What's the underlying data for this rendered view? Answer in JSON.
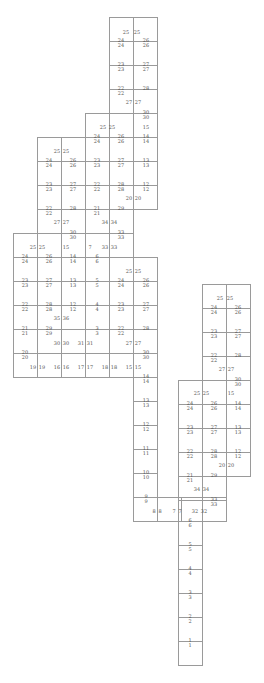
{
  "diagram": {
    "title": "",
    "cell_size": 24,
    "line_color": "#9a9a9a",
    "text_color": "#555555",
    "cells": [
      [
        109,
        17
      ],
      [
        133,
        17
      ],
      [
        109,
        41
      ],
      [
        133,
        41
      ],
      [
        109,
        65
      ],
      [
        133,
        65
      ],
      [
        109,
        89
      ],
      [
        133,
        89
      ],
      [
        85,
        113
      ],
      [
        109,
        113
      ],
      [
        133,
        113
      ],
      [
        37,
        137
      ],
      [
        61,
        137
      ],
      [
        85,
        137
      ],
      [
        109,
        137
      ],
      [
        133,
        137
      ],
      [
        37,
        161
      ],
      [
        61,
        161
      ],
      [
        85,
        161
      ],
      [
        109,
        161
      ],
      [
        133,
        161
      ],
      [
        37,
        185
      ],
      [
        61,
        185
      ],
      [
        85,
        185
      ],
      [
        109,
        185
      ],
      [
        133,
        185
      ],
      [
        37,
        209
      ],
      [
        61,
        209
      ],
      [
        85,
        209
      ],
      [
        109,
        209
      ],
      [
        13,
        233
      ],
      [
        37,
        233
      ],
      [
        61,
        233
      ],
      [
        85,
        233
      ],
      [
        109,
        233
      ],
      [
        13,
        257
      ],
      [
        37,
        257
      ],
      [
        61,
        257
      ],
      [
        85,
        257
      ],
      [
        109,
        257
      ],
      [
        133,
        257
      ],
      [
        13,
        281
      ],
      [
        37,
        281
      ],
      [
        61,
        281
      ],
      [
        85,
        281
      ],
      [
        109,
        281
      ],
      [
        133,
        281
      ],
      [
        13,
        305
      ],
      [
        37,
        305
      ],
      [
        61,
        305
      ],
      [
        85,
        305
      ],
      [
        109,
        305
      ],
      [
        133,
        305
      ],
      [
        13,
        329
      ],
      [
        37,
        329
      ],
      [
        61,
        329
      ],
      [
        85,
        329
      ],
      [
        109,
        329
      ],
      [
        133,
        329
      ],
      [
        13,
        353
      ],
      [
        37,
        353
      ],
      [
        61,
        353
      ],
      [
        85,
        353
      ],
      [
        109,
        353
      ],
      [
        133,
        353
      ],
      [
        133,
        377
      ],
      [
        133,
        401
      ],
      [
        133,
        425
      ],
      [
        133,
        449
      ],
      [
        133,
        473
      ],
      [
        133,
        497
      ],
      [
        202,
        284
      ],
      [
        226,
        284
      ],
      [
        202,
        308
      ],
      [
        226,
        308
      ],
      [
        202,
        332
      ],
      [
        226,
        332
      ],
      [
        202,
        356
      ],
      [
        226,
        356
      ],
      [
        178,
        380
      ],
      [
        202,
        380
      ],
      [
        226,
        380
      ],
      [
        178,
        404
      ],
      [
        202,
        404
      ],
      [
        226,
        404
      ],
      [
        178,
        428
      ],
      [
        202,
        428
      ],
      [
        226,
        428
      ],
      [
        178,
        452
      ],
      [
        202,
        452
      ],
      [
        226,
        452
      ],
      [
        178,
        476
      ],
      [
        202,
        476
      ],
      [
        157,
        497
      ],
      [
        178,
        497
      ],
      [
        202,
        497
      ],
      [
        178,
        521
      ],
      [
        178,
        545
      ],
      [
        178,
        569
      ],
      [
        178,
        593
      ],
      [
        178,
        617
      ],
      [
        178,
        641
      ]
    ],
    "labels": [
      {
        "x": 126,
        "y": 32,
        "t": "25"
      },
      {
        "x": 137,
        "y": 32,
        "t": "25"
      },
      {
        "x": 121,
        "y": 40,
        "t": "24"
      },
      {
        "x": 146,
        "y": 40,
        "t": "26"
      },
      {
        "x": 121,
        "y": 45,
        "t": "24"
      },
      {
        "x": 146,
        "y": 45,
        "t": "26"
      },
      {
        "x": 121,
        "y": 64,
        "t": "23"
      },
      {
        "x": 146,
        "y": 64,
        "t": "27"
      },
      {
        "x": 121,
        "y": 69,
        "t": "23"
      },
      {
        "x": 146,
        "y": 69,
        "t": "27"
      },
      {
        "x": 121,
        "y": 88,
        "t": "22"
      },
      {
        "x": 146,
        "y": 88,
        "t": "28"
      },
      {
        "x": 121,
        "y": 93,
        "t": "22"
      },
      {
        "x": 129,
        "y": 102,
        "t": "27"
      },
      {
        "x": 138,
        "y": 102,
        "t": "27"
      },
      {
        "x": 146,
        "y": 112,
        "t": "30"
      },
      {
        "x": 146,
        "y": 117,
        "t": "30"
      },
      {
        "x": 103,
        "y": 127,
        "t": "25"
      },
      {
        "x": 112,
        "y": 127,
        "t": "25"
      },
      {
        "x": 146,
        "y": 127,
        "t": "15"
      },
      {
        "x": 97,
        "y": 136,
        "t": "24"
      },
      {
        "x": 121,
        "y": 136,
        "t": "26"
      },
      {
        "x": 146,
        "y": 136,
        "t": "14"
      },
      {
        "x": 97,
        "y": 141,
        "t": "24"
      },
      {
        "x": 121,
        "y": 141,
        "t": "26"
      },
      {
        "x": 146,
        "y": 141,
        "t": "14"
      },
      {
        "x": 57,
        "y": 151,
        "t": "25"
      },
      {
        "x": 66,
        "y": 151,
        "t": "25"
      },
      {
        "x": 49,
        "y": 160,
        "t": "24"
      },
      {
        "x": 73,
        "y": 160,
        "t": "26"
      },
      {
        "x": 97,
        "y": 160,
        "t": "23"
      },
      {
        "x": 121,
        "y": 160,
        "t": "27"
      },
      {
        "x": 146,
        "y": 160,
        "t": "13"
      },
      {
        "x": 49,
        "y": 165,
        "t": "24"
      },
      {
        "x": 73,
        "y": 165,
        "t": "26"
      },
      {
        "x": 97,
        "y": 165,
        "t": "23"
      },
      {
        "x": 121,
        "y": 165,
        "t": "27"
      },
      {
        "x": 146,
        "y": 165,
        "t": "13"
      },
      {
        "x": 49,
        "y": 184,
        "t": "23"
      },
      {
        "x": 73,
        "y": 184,
        "t": "27"
      },
      {
        "x": 97,
        "y": 184,
        "t": "22"
      },
      {
        "x": 121,
        "y": 184,
        "t": "28"
      },
      {
        "x": 146,
        "y": 184,
        "t": "12"
      },
      {
        "x": 49,
        "y": 189,
        "t": "23"
      },
      {
        "x": 73,
        "y": 189,
        "t": "27"
      },
      {
        "x": 97,
        "y": 189,
        "t": "22"
      },
      {
        "x": 121,
        "y": 189,
        "t": "28"
      },
      {
        "x": 146,
        "y": 189,
        "t": "12"
      },
      {
        "x": 129,
        "y": 198,
        "t": "20"
      },
      {
        "x": 138,
        "y": 198,
        "t": "20"
      },
      {
        "x": 49,
        "y": 208,
        "t": "22"
      },
      {
        "x": 73,
        "y": 208,
        "t": "28"
      },
      {
        "x": 97,
        "y": 208,
        "t": "21"
      },
      {
        "x": 121,
        "y": 208,
        "t": "29"
      },
      {
        "x": 49,
        "y": 213,
        "t": "22"
      },
      {
        "x": 97,
        "y": 213,
        "t": "21"
      },
      {
        "x": 57,
        "y": 222,
        "t": "27"
      },
      {
        "x": 66,
        "y": 222,
        "t": "27"
      },
      {
        "x": 105,
        "y": 222,
        "t": "34"
      },
      {
        "x": 114,
        "y": 222,
        "t": "34"
      },
      {
        "x": 73,
        "y": 232,
        "t": "30"
      },
      {
        "x": 121,
        "y": 232,
        "t": "33"
      },
      {
        "x": 73,
        "y": 237,
        "t": "30"
      },
      {
        "x": 121,
        "y": 237,
        "t": "33"
      },
      {
        "x": 33,
        "y": 247,
        "t": "25"
      },
      {
        "x": 42,
        "y": 247,
        "t": "25"
      },
      {
        "x": 66,
        "y": 247,
        "t": "15"
      },
      {
        "x": 90,
        "y": 247,
        "t": "7"
      },
      {
        "x": 105,
        "y": 247,
        "t": "33"
      },
      {
        "x": 114,
        "y": 247,
        "t": "33"
      },
      {
        "x": 25,
        "y": 256,
        "t": "24"
      },
      {
        "x": 49,
        "y": 256,
        "t": "26"
      },
      {
        "x": 73,
        "y": 256,
        "t": "14"
      },
      {
        "x": 97,
        "y": 256,
        "t": "6"
      },
      {
        "x": 25,
        "y": 261,
        "t": "24"
      },
      {
        "x": 49,
        "y": 261,
        "t": "26"
      },
      {
        "x": 73,
        "y": 261,
        "t": "14"
      },
      {
        "x": 97,
        "y": 261,
        "t": "6"
      },
      {
        "x": 129,
        "y": 271,
        "t": "25"
      },
      {
        "x": 138,
        "y": 271,
        "t": "25"
      },
      {
        "x": 25,
        "y": 280,
        "t": "23"
      },
      {
        "x": 49,
        "y": 280,
        "t": "27"
      },
      {
        "x": 73,
        "y": 280,
        "t": "13"
      },
      {
        "x": 97,
        "y": 280,
        "t": "5"
      },
      {
        "x": 121,
        "y": 280,
        "t": "24"
      },
      {
        "x": 146,
        "y": 280,
        "t": "26"
      },
      {
        "x": 25,
        "y": 285,
        "t": "23"
      },
      {
        "x": 49,
        "y": 285,
        "t": "27"
      },
      {
        "x": 73,
        "y": 285,
        "t": "13"
      },
      {
        "x": 97,
        "y": 285,
        "t": "5"
      },
      {
        "x": 121,
        "y": 285,
        "t": "24"
      },
      {
        "x": 146,
        "y": 285,
        "t": "26"
      },
      {
        "x": 25,
        "y": 304,
        "t": "22"
      },
      {
        "x": 49,
        "y": 304,
        "t": "28"
      },
      {
        "x": 73,
        "y": 304,
        "t": "12"
      },
      {
        "x": 97,
        "y": 304,
        "t": "4"
      },
      {
        "x": 121,
        "y": 304,
        "t": "23"
      },
      {
        "x": 146,
        "y": 304,
        "t": "27"
      },
      {
        "x": 25,
        "y": 309,
        "t": "22"
      },
      {
        "x": 49,
        "y": 309,
        "t": "28"
      },
      {
        "x": 73,
        "y": 309,
        "t": "12"
      },
      {
        "x": 97,
        "y": 309,
        "t": "4"
      },
      {
        "x": 121,
        "y": 309,
        "t": "23"
      },
      {
        "x": 146,
        "y": 309,
        "t": "27"
      },
      {
        "x": 57,
        "y": 318,
        "t": "35"
      },
      {
        "x": 66,
        "y": 318,
        "t": "36"
      },
      {
        "x": 25,
        "y": 328,
        "t": "21"
      },
      {
        "x": 49,
        "y": 328,
        "t": "29"
      },
      {
        "x": 97,
        "y": 328,
        "t": "3"
      },
      {
        "x": 121,
        "y": 328,
        "t": "22"
      },
      {
        "x": 146,
        "y": 328,
        "t": "28"
      },
      {
        "x": 25,
        "y": 333,
        "t": "21"
      },
      {
        "x": 49,
        "y": 333,
        "t": "29"
      },
      {
        "x": 97,
        "y": 333,
        "t": "3"
      },
      {
        "x": 121,
        "y": 333,
        "t": "22"
      },
      {
        "x": 57,
        "y": 343,
        "t": "30"
      },
      {
        "x": 66,
        "y": 343,
        "t": "30"
      },
      {
        "x": 81,
        "y": 343,
        "t": "31"
      },
      {
        "x": 90,
        "y": 343,
        "t": "31"
      },
      {
        "x": 129,
        "y": 343,
        "t": "27"
      },
      {
        "x": 138,
        "y": 343,
        "t": "27"
      },
      {
        "x": 25,
        "y": 352,
        "t": "20"
      },
      {
        "x": 146,
        "y": 352,
        "t": "30"
      },
      {
        "x": 25,
        "y": 357,
        "t": "20"
      },
      {
        "x": 146,
        "y": 357,
        "t": "30"
      },
      {
        "x": 33,
        "y": 367,
        "t": "19"
      },
      {
        "x": 42,
        "y": 367,
        "t": "19"
      },
      {
        "x": 57,
        "y": 367,
        "t": "16"
      },
      {
        "x": 66,
        "y": 367,
        "t": "16"
      },
      {
        "x": 81,
        "y": 367,
        "t": "17"
      },
      {
        "x": 90,
        "y": 367,
        "t": "17"
      },
      {
        "x": 105,
        "y": 367,
        "t": "18"
      },
      {
        "x": 114,
        "y": 367,
        "t": "18"
      },
      {
        "x": 129,
        "y": 367,
        "t": "15"
      },
      {
        "x": 138,
        "y": 367,
        "t": "15"
      },
      {
        "x": 146,
        "y": 376,
        "t": "14"
      },
      {
        "x": 146,
        "y": 381,
        "t": "14"
      },
      {
        "x": 146,
        "y": 400,
        "t": "13"
      },
      {
        "x": 146,
        "y": 405,
        "t": "13"
      },
      {
        "x": 146,
        "y": 424,
        "t": "12"
      },
      {
        "x": 146,
        "y": 429,
        "t": "12"
      },
      {
        "x": 146,
        "y": 448,
        "t": "11"
      },
      {
        "x": 146,
        "y": 453,
        "t": "11"
      },
      {
        "x": 146,
        "y": 472,
        "t": "10"
      },
      {
        "x": 146,
        "y": 477,
        "t": "10"
      },
      {
        "x": 146,
        "y": 496,
        "t": "9"
      },
      {
        "x": 146,
        "y": 501,
        "t": "9"
      },
      {
        "x": 154,
        "y": 511,
        "t": "8"
      },
      {
        "x": 160,
        "y": 511,
        "t": "8"
      },
      {
        "x": 174,
        "y": 511,
        "t": "7"
      },
      {
        "x": 180,
        "y": 511,
        "t": "7"
      },
      {
        "x": 195,
        "y": 511,
        "t": "32"
      },
      {
        "x": 204,
        "y": 511,
        "t": "32"
      },
      {
        "x": 220,
        "y": 298,
        "t": "25"
      },
      {
        "x": 230,
        "y": 298,
        "t": "25"
      },
      {
        "x": 214,
        "y": 307,
        "t": "24"
      },
      {
        "x": 238,
        "y": 307,
        "t": "26"
      },
      {
        "x": 214,
        "y": 312,
        "t": "24"
      },
      {
        "x": 238,
        "y": 312,
        "t": "26"
      },
      {
        "x": 214,
        "y": 331,
        "t": "23"
      },
      {
        "x": 238,
        "y": 331,
        "t": "27"
      },
      {
        "x": 214,
        "y": 336,
        "t": "23"
      },
      {
        "x": 238,
        "y": 336,
        "t": "27"
      },
      {
        "x": 214,
        "y": 355,
        "t": "22"
      },
      {
        "x": 238,
        "y": 355,
        "t": "28"
      },
      {
        "x": 214,
        "y": 360,
        "t": "22"
      },
      {
        "x": 222,
        "y": 369,
        "t": "27"
      },
      {
        "x": 231,
        "y": 369,
        "t": "27"
      },
      {
        "x": 238,
        "y": 379,
        "t": "30"
      },
      {
        "x": 238,
        "y": 384,
        "t": "30"
      },
      {
        "x": 197,
        "y": 393,
        "t": "25"
      },
      {
        "x": 206,
        "y": 393,
        "t": "25"
      },
      {
        "x": 231,
        "y": 393,
        "t": "15"
      },
      {
        "x": 190,
        "y": 403,
        "t": "24"
      },
      {
        "x": 214,
        "y": 403,
        "t": "26"
      },
      {
        "x": 238,
        "y": 403,
        "t": "14"
      },
      {
        "x": 190,
        "y": 408,
        "t": "24"
      },
      {
        "x": 214,
        "y": 408,
        "t": "26"
      },
      {
        "x": 238,
        "y": 408,
        "t": "14"
      },
      {
        "x": 190,
        "y": 427,
        "t": "23"
      },
      {
        "x": 214,
        "y": 427,
        "t": "27"
      },
      {
        "x": 238,
        "y": 427,
        "t": "13"
      },
      {
        "x": 190,
        "y": 432,
        "t": "23"
      },
      {
        "x": 214,
        "y": 432,
        "t": "27"
      },
      {
        "x": 238,
        "y": 432,
        "t": "13"
      },
      {
        "x": 190,
        "y": 451,
        "t": "22"
      },
      {
        "x": 214,
        "y": 451,
        "t": "28"
      },
      {
        "x": 238,
        "y": 451,
        "t": "12"
      },
      {
        "x": 190,
        "y": 456,
        "t": "22"
      },
      {
        "x": 214,
        "y": 456,
        "t": "28"
      },
      {
        "x": 238,
        "y": 456,
        "t": "12"
      },
      {
        "x": 222,
        "y": 465,
        "t": "20"
      },
      {
        "x": 231,
        "y": 465,
        "t": "20"
      },
      {
        "x": 190,
        "y": 475,
        "t": "21"
      },
      {
        "x": 214,
        "y": 475,
        "t": "29"
      },
      {
        "x": 190,
        "y": 480,
        "t": "21"
      },
      {
        "x": 197,
        "y": 489,
        "t": "34"
      },
      {
        "x": 206,
        "y": 489,
        "t": "34"
      },
      {
        "x": 214,
        "y": 499,
        "t": "33"
      },
      {
        "x": 214,
        "y": 504,
        "t": "33"
      },
      {
        "x": 190,
        "y": 520,
        "t": "6"
      },
      {
        "x": 190,
        "y": 525,
        "t": "6"
      },
      {
        "x": 190,
        "y": 544,
        "t": "5"
      },
      {
        "x": 190,
        "y": 549,
        "t": "5"
      },
      {
        "x": 190,
        "y": 568,
        "t": "4"
      },
      {
        "x": 190,
        "y": 573,
        "t": "4"
      },
      {
        "x": 190,
        "y": 592,
        "t": "3"
      },
      {
        "x": 190,
        "y": 597,
        "t": "3"
      },
      {
        "x": 190,
        "y": 616,
        "t": "2"
      },
      {
        "x": 190,
        "y": 621,
        "t": "2"
      },
      {
        "x": 190,
        "y": 640,
        "t": "1"
      },
      {
        "x": 190,
        "y": 645,
        "t": "1"
      }
    ]
  }
}
